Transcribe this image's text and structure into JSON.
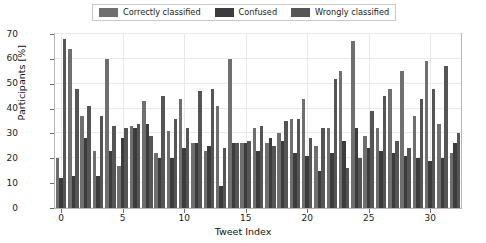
{
  "chart_data": {
    "type": "bar",
    "title": "",
    "xlabel": "Tweet Index",
    "ylabel": "Participants [%]",
    "ylim": [
      0,
      70
    ],
    "yticks": [
      0,
      10,
      20,
      30,
      40,
      50,
      60,
      70
    ],
    "xticks": [
      0,
      5,
      10,
      15,
      20,
      25,
      30
    ],
    "xlim": [
      -0.5,
      32.5
    ],
    "grid": true,
    "legend_position": "upper center",
    "categories": [
      0,
      1,
      2,
      3,
      4,
      5,
      6,
      7,
      8,
      9,
      10,
      11,
      12,
      13,
      14,
      15,
      16,
      17,
      18,
      19,
      20,
      21,
      22,
      23,
      24,
      25,
      26,
      27,
      28,
      29,
      30,
      31,
      32
    ],
    "series": [
      {
        "name": "Correctly classified",
        "color": "#6f6f6f",
        "values": [
          20,
          64,
          37,
          23,
          60,
          17,
          33,
          43,
          22,
          31,
          44,
          26,
          23,
          41,
          60,
          26,
          32,
          26,
          30,
          36,
          44,
          25,
          32,
          55,
          67,
          29,
          32,
          48,
          55,
          37,
          59,
          34,
          22
        ]
      },
      {
        "name": "Confused",
        "color": "#3c3c3c",
        "values": [
          12,
          13,
          28,
          13,
          23,
          28,
          32,
          34,
          20,
          20,
          24,
          26,
          25,
          9,
          26,
          26,
          23,
          28,
          27,
          22,
          21,
          15,
          22,
          27,
          32,
          24,
          23,
          22,
          21,
          20,
          19,
          20,
          26
        ]
      },
      {
        "name": "Wrongly classified",
        "color": "#555555",
        "values": [
          68,
          48,
          41,
          37,
          33,
          32,
          34,
          29,
          45,
          36,
          32,
          47,
          48,
          24,
          26,
          27,
          33,
          25,
          35,
          36,
          28,
          32,
          52,
          16,
          20,
          39,
          45,
          27,
          24,
          44,
          48,
          57,
          30
        ]
      }
    ]
  }
}
